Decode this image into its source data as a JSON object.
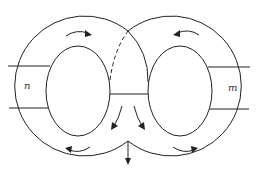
{
  "diagram": {
    "labels": {
      "left_handle": "n",
      "right_handle": "m"
    },
    "elements": {
      "left_annulus": {
        "outer_center": [
          77,
          80
        ],
        "outer_radius": 70,
        "inner_center": [
          78,
          91
        ],
        "inner_rx": 32,
        "inner_ry": 45
      },
      "right_annulus": {
        "outer_center": [
          179,
          80
        ],
        "outer_radius": 70,
        "inner_center": [
          180,
          91
        ],
        "inner_rx": 32,
        "inner_ry": 45
      },
      "center_bridge_line": {
        "from": [
          110,
          94
        ],
        "to": [
          148,
          94
        ]
      },
      "dashed_arc": {
        "from": [
          110,
          80
        ],
        "to": [
          128,
          31
        ]
      },
      "outflow_arrow": {
        "from": [
          128,
          141
        ],
        "to": [
          128,
          164
        ],
        "direction": "down"
      }
    },
    "arrows": [
      {
        "id": "top-left",
        "direction": "clockwise"
      },
      {
        "id": "top-right",
        "direction": "counterclockwise"
      },
      {
        "id": "bottom-left",
        "direction": "clockwise"
      },
      {
        "id": "bottom-right",
        "direction": "counterclockwise"
      },
      {
        "id": "center-left-down",
        "direction": "down-left"
      },
      {
        "id": "center-right-down",
        "direction": "down-right"
      }
    ],
    "colors": {
      "line": "#222222",
      "background": "#ffffff"
    }
  }
}
